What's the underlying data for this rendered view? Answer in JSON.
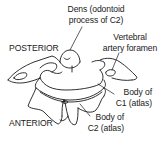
{
  "figure": {
    "orientation": {
      "top": "POSTERIOR",
      "bottom": "ANTERIOR"
    },
    "labels": {
      "dens": {
        "line1": "Dens (odontoid",
        "line2": "process of C2)"
      },
      "vertebral_artery_foramen": {
        "line1": "Vertebral",
        "line2": "artery foramen"
      },
      "body_c1": {
        "line1": "Body of",
        "line2": "C1 (atlas)"
      },
      "body_c2": {
        "line1": "Body of",
        "line2": "C2 (atlas)"
      }
    },
    "colors": {
      "line": "#1a1a1a",
      "background": "#ffffff"
    }
  }
}
